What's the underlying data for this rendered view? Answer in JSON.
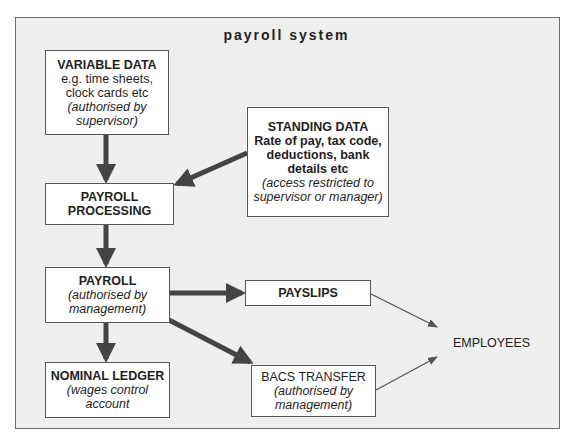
{
  "title": "payroll system",
  "boxes": {
    "variable_data": {
      "heading": "VARIABLE DATA",
      "line1": "e.g. time sheets,",
      "line2": "clock cards etc",
      "note1": "(authorised by",
      "note2": "supervisor)"
    },
    "standing_data": {
      "heading": "STANDING DATA",
      "line1": "Rate of pay, tax code,",
      "line2": "deductions, bank",
      "line3": "details etc",
      "note1": "(access restricted to",
      "note2": "supervisor or manager)"
    },
    "payroll_processing": {
      "line1": "PAYROLL",
      "line2": "PROCESSING"
    },
    "payroll": {
      "heading": "PAYROLL",
      "note1": "(authorised by",
      "note2": "management)"
    },
    "payslips": {
      "heading": "PAYSLIPS"
    },
    "nominal_ledger": {
      "heading": "NOMINAL LEDGER",
      "note1": "(wages control",
      "note2": "account"
    },
    "bacs_transfer": {
      "heading": "BACS TRANSFER",
      "note1": "(authorised by",
      "note2": "management)"
    }
  },
  "employees": "EMPLOYEES",
  "colors": {
    "frame_bg": "#efefef",
    "frame_border": "#6e6e6e",
    "box_bg": "#ffffff",
    "thick_arrow": "#444444",
    "thin_arrow": "#555555"
  },
  "flows": [
    {
      "from": "VARIABLE DATA",
      "to": "PAYROLL PROCESSING",
      "style": "thick"
    },
    {
      "from": "STANDING DATA",
      "to": "PAYROLL PROCESSING",
      "style": "thick"
    },
    {
      "from": "PAYROLL PROCESSING",
      "to": "PAYROLL",
      "style": "thick"
    },
    {
      "from": "PAYROLL",
      "to": "PAYSLIPS",
      "style": "thick"
    },
    {
      "from": "PAYROLL",
      "to": "NOMINAL LEDGER",
      "style": "thick"
    },
    {
      "from": "PAYROLL",
      "to": "BACS TRANSFER",
      "style": "thick"
    },
    {
      "from": "PAYSLIPS",
      "to": "EMPLOYEES",
      "style": "thin"
    },
    {
      "from": "BACS TRANSFER",
      "to": "EMPLOYEES",
      "style": "thin"
    }
  ]
}
